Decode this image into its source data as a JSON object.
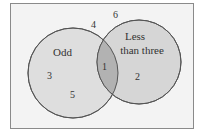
{
  "diagram": {
    "type": "venn",
    "sets": [
      {
        "label": "Odd",
        "elements": [
          "3",
          "5"
        ]
      },
      {
        "label_line1": "Less",
        "label_line2": "than three",
        "elements": [
          "2"
        ]
      }
    ],
    "intersection": [
      "1"
    ],
    "outside": [
      "4",
      "6"
    ],
    "colors": {
      "background": "#f3f3f3",
      "circle_fill": "#dcdcdc",
      "intersection_fill": "#b5b5b5",
      "stroke": "#555555"
    }
  },
  "labels": {
    "odd": "Odd",
    "less_line1": "Less",
    "less_line2": "than three",
    "n1": "1",
    "n2": "2",
    "n3": "3",
    "n4": "4",
    "n5": "5",
    "n6": "6"
  }
}
